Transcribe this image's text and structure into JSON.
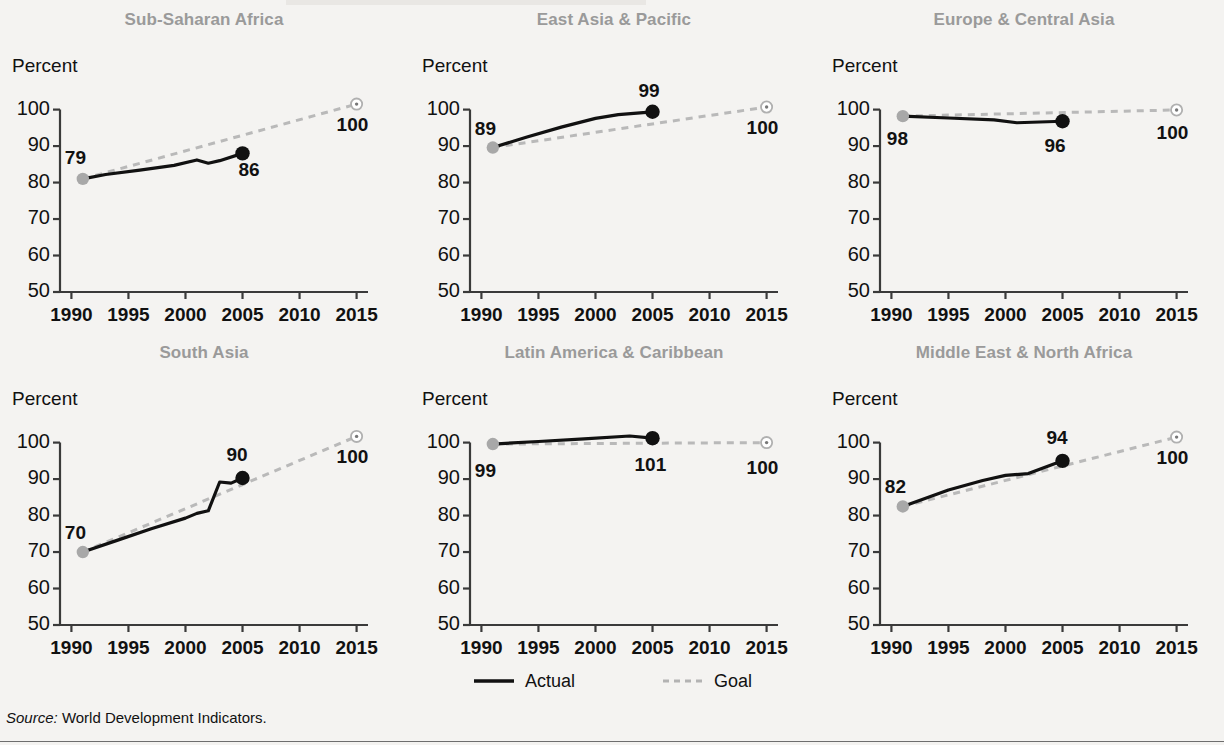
{
  "figure": {
    "source_prefix": "Source:",
    "source_text": "World Development Indicators."
  },
  "legend": {
    "actual_label": "Actual",
    "goal_label": "Goal",
    "actual_color": "#111111",
    "goal_color": "#b3b3b3"
  },
  "axis": {
    "y_label": "Percent",
    "y_ticks": [
      "100",
      "90",
      "80",
      "70",
      "60",
      "50"
    ],
    "x_ticks": [
      "1990",
      "1995",
      "2000",
      "2005",
      "2010",
      "2015"
    ],
    "ylim": [
      50,
      104
    ],
    "xlim": [
      1989,
      2016
    ]
  },
  "chart_data": {
    "type": "line",
    "title": "",
    "xlabel": "",
    "ylabel": "Percent",
    "ylim": [
      50,
      104
    ],
    "xlim": [
      1989,
      2016
    ],
    "grid": false,
    "legend_position": "bottom-center",
    "x_ticks": [
      1990,
      1995,
      2000,
      2005,
      2010,
      2015
    ],
    "y_ticks": [
      50,
      60,
      70,
      80,
      90,
      100
    ],
    "panels": [
      {
        "title": "Sub-Saharan Africa",
        "start_label": "79",
        "end_label": "86",
        "goal_label": "100",
        "series": [
          {
            "name": "Actual",
            "points": [
              [
                1991,
                81.0
              ],
              [
                1993,
                82.2
              ],
              [
                1996,
                83.4
              ],
              [
                1999,
                84.7
              ],
              [
                2001,
                86.2
              ],
              [
                2002,
                85.3
              ],
              [
                2003,
                86.0
              ],
              [
                2005,
                88.0
              ]
            ]
          },
          {
            "name": "Goal",
            "points": [
              [
                1991,
                81.0
              ],
              [
                2015,
                101.5
              ]
            ]
          }
        ]
      },
      {
        "title": "East Asia & Pacific",
        "start_label": "89",
        "end_label": "99",
        "goal_label": "100",
        "series": [
          {
            "name": "Actual",
            "points": [
              [
                1991,
                89.6
              ],
              [
                1994,
                92.5
              ],
              [
                1997,
                95.2
              ],
              [
                2000,
                97.6
              ],
              [
                2002,
                98.6
              ],
              [
                2005,
                99.4
              ]
            ]
          },
          {
            "name": "Goal",
            "points": [
              [
                1991,
                89.6
              ],
              [
                2015,
                100.7
              ]
            ]
          }
        ]
      },
      {
        "title": "Europe & Central Asia",
        "start_label": "98",
        "end_label": "96",
        "goal_label": "100",
        "series": [
          {
            "name": "Actual",
            "points": [
              [
                1991,
                98.2
              ],
              [
                1995,
                97.7
              ],
              [
                1999,
                97.2
              ],
              [
                2001,
                96.4
              ],
              [
                2003,
                96.6
              ],
              [
                2005,
                96.8
              ]
            ]
          },
          {
            "name": "Goal",
            "points": [
              [
                1991,
                98.2
              ],
              [
                2015,
                99.9
              ]
            ]
          }
        ]
      },
      {
        "title": "South Asia",
        "start_label": "70",
        "end_label": "90",
        "goal_label": "100",
        "series": [
          {
            "name": "Actual",
            "points": [
              [
                1991,
                70.0
              ],
              [
                1994,
                73.2
              ],
              [
                1997,
                76.4
              ],
              [
                2000,
                79.3
              ],
              [
                2001,
                80.6
              ],
              [
                2002,
                81.3
              ],
              [
                2003,
                89.2
              ],
              [
                2004,
                88.9
              ],
              [
                2005,
                90.3
              ]
            ]
          },
          {
            "name": "Goal",
            "points": [
              [
                1991,
                70.0
              ],
              [
                2015,
                101.7
              ]
            ]
          }
        ]
      },
      {
        "title": "Latin America & Caribbean",
        "start_label": "99",
        "end_label": "101",
        "goal_label": "100",
        "series": [
          {
            "name": "Actual",
            "points": [
              [
                1991,
                99.6
              ],
              [
                1995,
                100.3
              ],
              [
                1999,
                101.0
              ],
              [
                2003,
                101.8
              ],
              [
                2005,
                101.2
              ]
            ]
          },
          {
            "name": "Goal",
            "points": [
              [
                1991,
                99.6
              ],
              [
                2015,
                100.0
              ]
            ]
          }
        ]
      },
      {
        "title": "Middle East & North Africa",
        "start_label": "82",
        "end_label": "94",
        "goal_label": "100",
        "series": [
          {
            "name": "Actual",
            "points": [
              [
                1991,
                82.5
              ],
              [
                1995,
                87.0
              ],
              [
                1998,
                89.6
              ],
              [
                2000,
                91.0
              ],
              [
                2002,
                91.5
              ],
              [
                2005,
                95.0
              ]
            ]
          },
          {
            "name": "Goal",
            "points": [
              [
                1991,
                82.5
              ],
              [
                2015,
                101.5
              ]
            ]
          }
        ]
      }
    ]
  }
}
